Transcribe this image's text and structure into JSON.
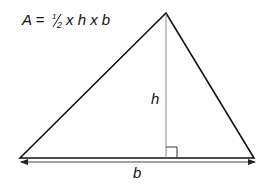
{
  "diagram": {
    "formula": {
      "prefix": "A =",
      "fraction_num": "1",
      "fraction_den": "2",
      "suffix": "x h x b"
    },
    "labels": {
      "height": "h",
      "base": "b"
    },
    "triangle": {
      "left": [
        20,
        158
      ],
      "apex": [
        166,
        13
      ],
      "right": [
        254,
        158
      ]
    },
    "colors": {
      "stroke": "#111111",
      "height_line": "#8a8a8a",
      "arrow": "#444444"
    }
  }
}
